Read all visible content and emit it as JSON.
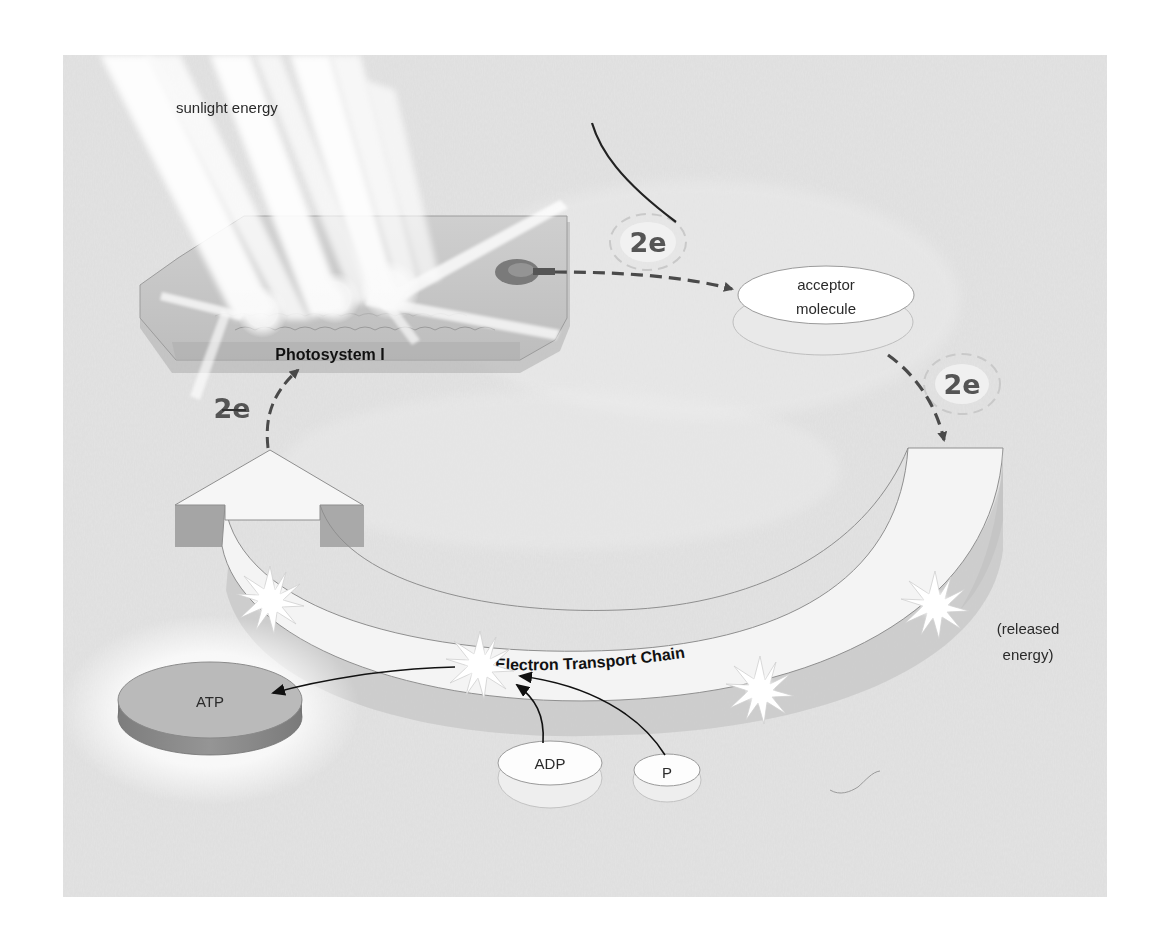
{
  "diagram": {
    "type": "cyclic-photophosphorylation",
    "background_color": "#e4e4e4",
    "labels": {
      "sunlight": "sunlight energy",
      "photosystem": "Photosystem I",
      "acceptor_line1": "acceptor",
      "acceptor_line2": "molecule",
      "electron_pair_top": "2e",
      "electron_pair_right": "2e",
      "electron_pair_left": "2e",
      "transport_chain": "Electron Transport Chain",
      "released_line1": "(released",
      "released_line2": "energy)",
      "atp": "ATP",
      "adp": "ADP",
      "phosphate": "P"
    },
    "flow": [
      {
        "from": "Photosystem I",
        "to": "acceptor molecule",
        "carrier": "2e",
        "style": "dashed"
      },
      {
        "from": "acceptor molecule",
        "to": "Electron Transport Chain",
        "carrier": "2e",
        "style": "dashed"
      },
      {
        "from": "Electron Transport Chain",
        "to": "Photosystem I",
        "carrier": "2e",
        "style": "dashed"
      },
      {
        "from": "ADP",
        "to": "released energy",
        "style": "solid"
      },
      {
        "from": "P",
        "to": "released energy",
        "style": "solid"
      },
      {
        "from": "released energy",
        "to": "ATP",
        "style": "solid"
      }
    ],
    "colors": {
      "atp_top": "#b9b9b9",
      "atp_side": "#8c8c8c",
      "arrow_dashed": "#555555",
      "arrow_solid": "#111111",
      "chain_fill": "#f3f3f3"
    }
  }
}
